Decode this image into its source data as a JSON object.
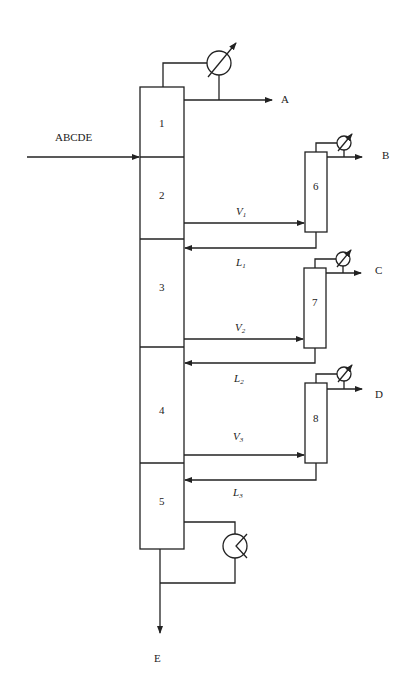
{
  "feed": {
    "label": "ABCDE"
  },
  "products": {
    "A": "A",
    "B": "B",
    "C": "C",
    "D": "D",
    "E": "E"
  },
  "main_column": {
    "sections": [
      {
        "id": "1",
        "label": "1"
      },
      {
        "id": "2",
        "label": "2"
      },
      {
        "id": "3",
        "label": "3"
      },
      {
        "id": "4",
        "label": "4"
      },
      {
        "id": "5",
        "label": "5"
      }
    ]
  },
  "side_columns": [
    {
      "id": "6",
      "label": "6",
      "product": "B"
    },
    {
      "id": "7",
      "label": "7",
      "product": "C"
    },
    {
      "id": "8",
      "label": "8",
      "product": "D"
    }
  ],
  "streams": {
    "V1": {
      "main": "V",
      "sub": "1"
    },
    "L1": {
      "main": "L",
      "sub": "1"
    },
    "V2": {
      "main": "V",
      "sub": "2"
    },
    "L2": {
      "main": "L",
      "sub": "2"
    },
    "V3": {
      "main": "V",
      "sub": "3"
    },
    "L3": {
      "main": "L",
      "sub": "3"
    }
  }
}
